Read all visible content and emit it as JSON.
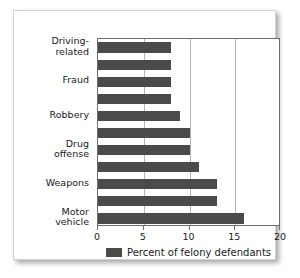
{
  "chart_data": {
    "type": "bar",
    "orientation": "horizontal",
    "title": "",
    "xlabel": "",
    "ylabel": "",
    "xlim": [
      0,
      20
    ],
    "xticks": [
      "0",
      "5",
      "10",
      "15",
      "20"
    ],
    "xtick_values": [
      0,
      5,
      10,
      15,
      20
    ],
    "gridlines": [
      5,
      10,
      15
    ],
    "grid": true,
    "legend_position": "bottom-center",
    "legend": [
      "Percent of felony defendants"
    ],
    "categories": [
      "Driving-\nrelated",
      "",
      "Fraud",
      "",
      "Robbery",
      "",
      "Drug\noffense",
      "",
      "Weapons",
      "",
      "Motor\nvehicle"
    ],
    "values": [
      8,
      8,
      8,
      8,
      9,
      10,
      10,
      11,
      13,
      13,
      16
    ],
    "series": [
      {
        "name": "Percent of felony defendants",
        "values": [
          8,
          8,
          8,
          8,
          9,
          10,
          10,
          11,
          13,
          13,
          16
        ]
      }
    ],
    "bar_color": "#4a4a4a",
    "plot_border_color": "#6e6e6e",
    "grid_color": "#b4b4b4",
    "background": "#ffffff"
  },
  "legend": {
    "label": "Percent of felony defendants"
  }
}
